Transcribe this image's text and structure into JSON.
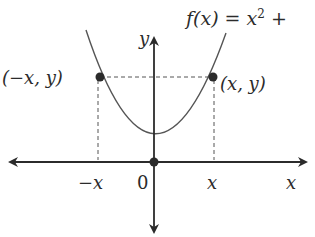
{
  "diagram": {
    "function_label": {
      "prefix": "f(x) = x",
      "exponent": "2",
      "suffix": " +"
    },
    "axes": {
      "x_label": "x",
      "y_label": "y",
      "origin_label": "0"
    },
    "ticks": {
      "neg_x_label": "−x",
      "pos_x_label": "x"
    },
    "points": [
      {
        "label": "(−x, y)",
        "side": "left"
      },
      {
        "label": "(x, y)",
        "side": "right"
      }
    ],
    "colors": {
      "ink": "#2b2b2b",
      "curve": "#555555",
      "dashes": "#555555",
      "background": "#ffffff"
    }
  }
}
